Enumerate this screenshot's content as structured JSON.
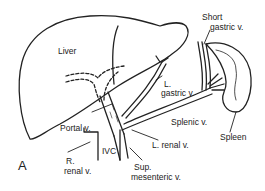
{
  "figure": {
    "panel_letter": "A",
    "labels": {
      "liver": "Liver",
      "short_gastric_1": "Short",
      "short_gastric_2": "gastric v.",
      "l_gastric_1": "L.",
      "l_gastric_2": "gastric v.",
      "splenic": "Splenic v.",
      "spleen": "Spleen",
      "portal": "Portal v.",
      "ivc": "IVC",
      "r_renal_1": "R.",
      "r_renal_2": "renal v.",
      "l_renal": "L. renal v.",
      "sup_mes_1": "Sup.",
      "sup_mes_2": "mesenteric v."
    }
  }
}
